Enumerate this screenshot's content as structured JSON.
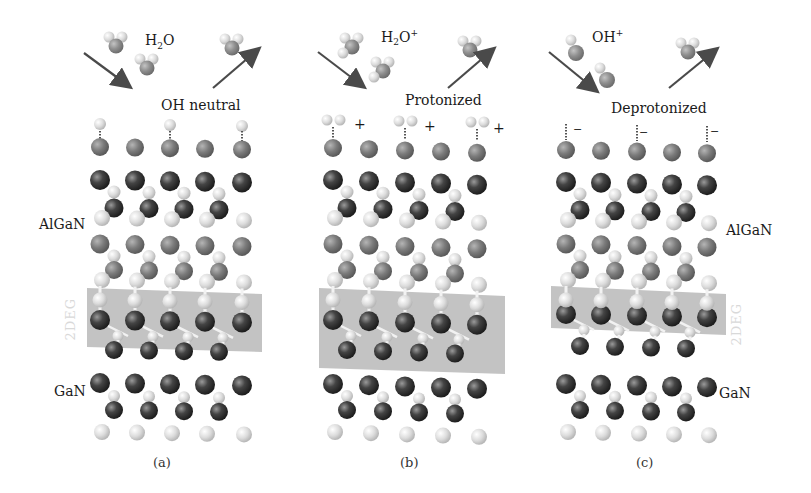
{
  "figure": {
    "panels": [
      {
        "id": "a",
        "caption": "(a)",
        "incoming_species": "H2O",
        "incoming_species_parts": {
          "base": "H",
          "sub": "2",
          "rest": "O",
          "sup": ""
        },
        "surface_state": "OH neutral",
        "layer_labels": {
          "top": "AlGaN",
          "bottom": "GaN"
        },
        "channel_label": "2DEG",
        "surface_charge_marks": []
      },
      {
        "id": "b",
        "caption": "(b)",
        "incoming_species": "H2O+",
        "incoming_species_parts": {
          "base": "H",
          "sub": "2",
          "rest": "O",
          "sup": "+"
        },
        "surface_state": "Protonized",
        "layer_labels": {
          "top": "",
          "bottom": ""
        },
        "channel_label": "",
        "surface_charge_marks": [
          "+",
          "+",
          "+"
        ]
      },
      {
        "id": "c",
        "caption": "(c)",
        "incoming_species": "OH+",
        "incoming_species_parts": {
          "base": "OH",
          "sub": "",
          "rest": "",
          "sup": "+"
        },
        "surface_state": "Deprotonized",
        "layer_labels": {
          "top": "AlGaN",
          "bottom": "GaN"
        },
        "channel_label": "2DEG",
        "surface_charge_marks": [
          "−",
          "−",
          "−"
        ]
      }
    ],
    "colors": {
      "ga_atom": "#3a3a3a",
      "al_atom": "#7a7a7a",
      "n_atom": "#d8d8d8",
      "oxygen_atom": "#8a8a8a",
      "hydrogen_atom": "#e4e4e4",
      "channel_band": "#b9b9b9",
      "arrow": "#4a4a4a",
      "channel_label": "#d9d9d9"
    }
  }
}
